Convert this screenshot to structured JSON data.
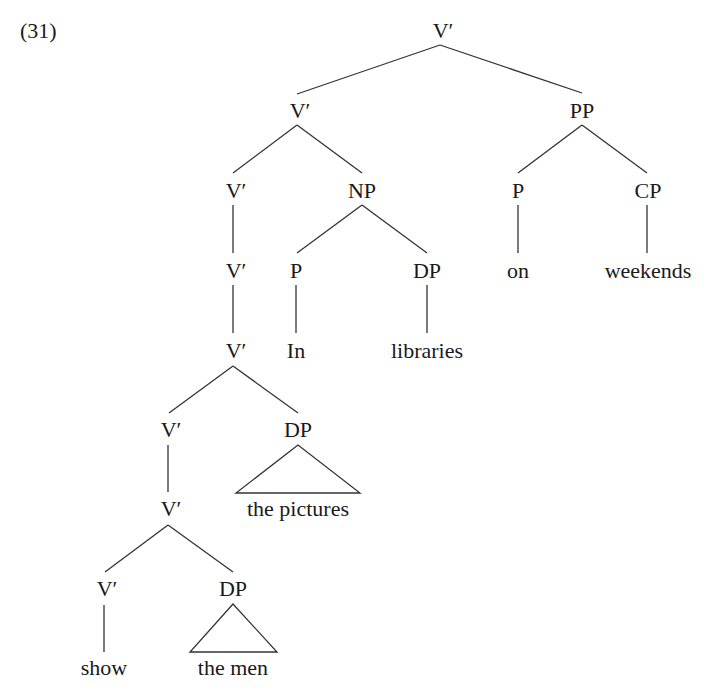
{
  "example_number": "(31)",
  "nodes": {
    "root": "V′",
    "v2": "V′",
    "pp": "PP",
    "v3": "V′",
    "np": "NP",
    "p_on": "P",
    "cp": "CP",
    "v4": "V′",
    "p_in": "P",
    "dp_lib": "DP",
    "word_on": "on",
    "word_weekends": "weekends",
    "v5": "V′",
    "word_in": "In",
    "word_libraries": "libraries",
    "v6": "V′",
    "dp_pictures": "DP",
    "v7": "V′",
    "phrase_pictures": "the pictures",
    "v8": "V′",
    "dp_men": "DP",
    "word_show": "show",
    "phrase_men": "the men"
  }
}
